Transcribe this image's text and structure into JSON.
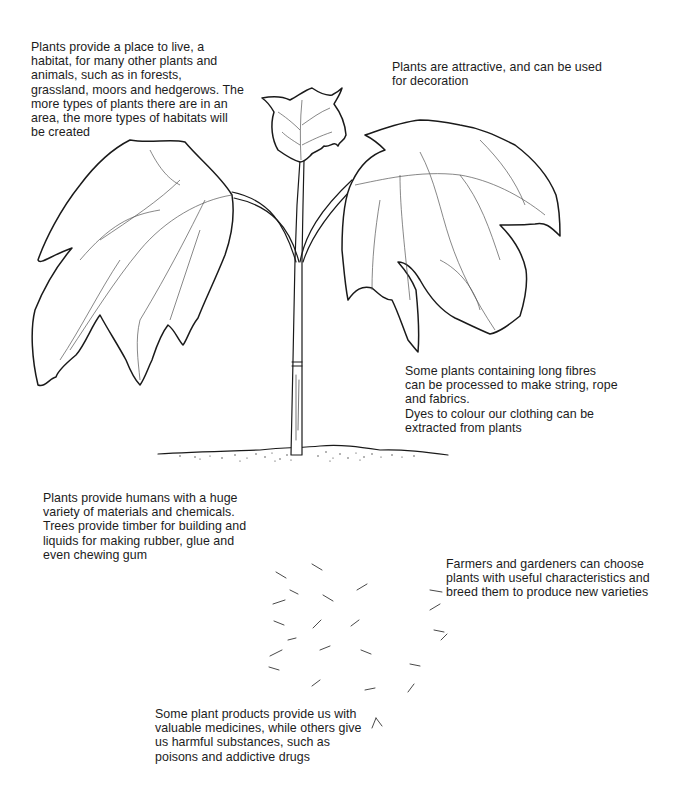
{
  "diagram": {
    "captions": {
      "habitat": "Plants provide a place to live, a\nhabitat, for many other plants and\nanimals, such as in forests,\ngrassland, moors and hedgerows. The\nmore types of plants there are in an\narea, the more types of habitats will\nbe created",
      "decoration": "Plants are attractive, and can be used\nfor decoration",
      "fibres": "Some plants containing long fibres\ncan be processed to make string, rope\nand fabrics.\nDyes to colour our clothing can be\nextracted from plants",
      "materials": "Plants provide humans with a huge\nvariety of materials and chemicals.\nTrees provide timber for building and\nliquids for making rubber, glue and\neven chewing gum",
      "breeding": "Farmers and gardeners can choose\nplants with useful characteristics and\nbreed them to produce new varieties",
      "medicines": "Some plant products provide us with\nvaluable medicines, while others give\nus harmful substances, such as\npoisons and addictive drugs"
    },
    "parts": [
      "left-leaf",
      "top-leaf",
      "right-leaf",
      "stem",
      "soil-line",
      "roots"
    ],
    "colors": {
      "ink": "#1a1a1a",
      "background": "#ffffff"
    }
  }
}
